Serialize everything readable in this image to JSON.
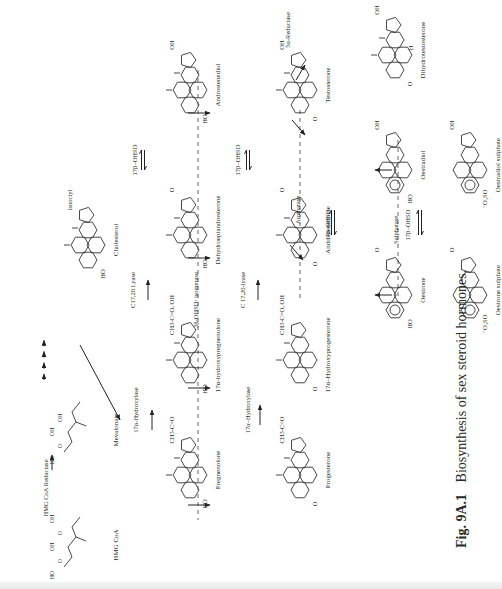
{
  "figure": {
    "caption_label": "Fig. 9A.1",
    "caption_text": "Biosynthesis of sex steroid hormones.",
    "caption_pos": {
      "x": 466,
      "y": 548
    },
    "rotation_deg": -90
  },
  "compounds": [
    {
      "id": "hmg-coa",
      "name": "HMG CoA",
      "x": 78,
      "y": 545,
      "kind": "acyclic",
      "groups": [
        "HO",
        "O",
        "OH",
        "O",
        "OH"
      ]
    },
    {
      "id": "mevalonate",
      "name": "Mevalonate",
      "x": 78,
      "y": 430,
      "kind": "acyclic",
      "groups": [
        "HO",
        "O",
        "OH",
        "OH"
      ]
    },
    {
      "id": "cholesterol",
      "name": "Cholesterol",
      "x": 78,
      "y": 240,
      "kind": "steroid",
      "ring_a": "HO",
      "side": "isooctyl"
    },
    {
      "id": "pregnenolone",
      "name": "Pregnenolone",
      "x": 180,
      "y": 470,
      "kind": "steroid",
      "ring_a": "HO",
      "side": "CH3-C=O"
    },
    {
      "id": "17a-hydroxypregnenolone",
      "name": "17α-hydroxypregnenolone",
      "x": 180,
      "y": 355,
      "kind": "steroid",
      "ring_a": "HO",
      "side": "CH3-C=O, OH"
    },
    {
      "id": "dehydroepiandrosterone",
      "name": "Dehydroepiandrosterone",
      "x": 180,
      "y": 230,
      "kind": "steroid",
      "ring_a": "HO",
      "side": "O"
    },
    {
      "id": "androstenediol",
      "name": "Androstenediol",
      "x": 180,
      "y": 85,
      "kind": "steroid",
      "ring_a": "HO",
      "side": "OH"
    },
    {
      "id": "progesterone",
      "name": "Progesterone",
      "x": 290,
      "y": 470,
      "kind": "steroid",
      "ring_a": "O",
      "side": "CH3-C=O"
    },
    {
      "id": "17a-hydroxyprogesterone",
      "name": "17α–Hydroxyprogesterone",
      "x": 290,
      "y": 355,
      "kind": "steroid",
      "ring_a": "O",
      "side": "CH3-C=O, OH"
    },
    {
      "id": "androstenedione",
      "name": "Androstenedione",
      "x": 290,
      "y": 230,
      "kind": "steroid",
      "ring_a": "O",
      "side": "O"
    },
    {
      "id": "testosterone",
      "name": "Testosterone",
      "x": 290,
      "y": 85,
      "kind": "steroid",
      "ring_a": "O",
      "side": "OH"
    },
    {
      "id": "oestrone",
      "name": "Oestrone",
      "x": 385,
      "y": 290,
      "kind": "aromatic",
      "ring_a": "HO",
      "side": "O"
    },
    {
      "id": "oestradiol",
      "name": "Oestradiol",
      "x": 385,
      "y": 165,
      "kind": "aromatic",
      "ring_a": "HO",
      "side": "OH"
    },
    {
      "id": "dihydrotestosterone",
      "name": "Dihydrotestosterone",
      "x": 385,
      "y": 50,
      "kind": "steroid",
      "ring_a": "O",
      "side": "OH",
      "extra": "H"
    },
    {
      "id": "oestrone-sulphate",
      "name": "Oestrone sulphate",
      "x": 460,
      "y": 290,
      "kind": "aromatic",
      "ring_a": "⁻O₃SO",
      "side": "O"
    },
    {
      "id": "oestradiol-sulphate",
      "name": "Oestradiol sulphate",
      "x": 460,
      "y": 165,
      "kind": "aromatic",
      "ring_a": "⁻O₃SO",
      "side": "OH"
    }
  ],
  "enzymes": [
    {
      "id": "hmg-coa-reductase",
      "label": "HMG CoA Reductase",
      "x": 48,
      "y": 488
    },
    {
      "id": "17a-hydroxylase-1",
      "label": "17α-Hydroxylase",
      "x": 138,
      "y": 410
    },
    {
      "id": "c1720-lyase-1",
      "label": "C17,20 Lyase",
      "x": 135,
      "y": 290
    },
    {
      "id": "17b-ohsd-1",
      "label": "17β–OHSD",
      "x": 137,
      "y": 160
    },
    {
      "id": "3b-ohsd-isomerase",
      "label": "3β-OHSD/ isomerase",
      "x": 198,
      "y": 300
    },
    {
      "id": "17a-hydroxylase-2",
      "label": "17α–Hydroxylase",
      "x": 250,
      "y": 410
    },
    {
      "id": "c1720-lyase-2",
      "label": "C 17,20-lyase",
      "x": 245,
      "y": 290
    },
    {
      "id": "17b-ohsd-2",
      "label": "17β–OHSD",
      "x": 240,
      "y": 160
    },
    {
      "id": "5a-reductase",
      "label": "5α-Reductase",
      "x": 290,
      "y": 30
    },
    {
      "id": "aromatase",
      "label": "Aromatase",
      "x": 300,
      "y": 210
    },
    {
      "id": "17b-ohsd-3",
      "label": "17β–OHSD",
      "x": 330,
      "y": 225
    },
    {
      "id": "sulphatase",
      "label": "Sulphatase",
      "x": 398,
      "y": 230
    },
    {
      "id": "17b-ohsd-4",
      "label": "17β–OHSD",
      "x": 410,
      "y": 225
    }
  ],
  "separators": [
    {
      "id": "sep-3b-ohsd",
      "x": 198,
      "y1": 70,
      "y2": 520
    },
    {
      "id": "sep-aromatase",
      "x": 300,
      "y1": 110,
      "y2": 300
    },
    {
      "id": "sep-sulphatase",
      "x": 398,
      "y1": 140,
      "y2": 300
    }
  ],
  "arrows": [
    {
      "id": "hmg-to-mev",
      "x1": 52,
      "y1": 470,
      "x2": 52,
      "y2": 455
    },
    {
      "id": "mev-to-chol",
      "dotted": true,
      "x1": 44,
      "y1": 380,
      "x2": 44,
      "y2": 335
    },
    {
      "id": "chol-to-preg",
      "x1": 80,
      "y1": 345,
      "x2": 120,
      "y2": 420
    },
    {
      "id": "preg-to-17oh",
      "x1": 152,
      "y1": 430,
      "x2": 152,
      "y2": 410
    },
    {
      "id": "17oh-to-dhea",
      "x1": 148,
      "y1": 300,
      "x2": 148,
      "y2": 280
    },
    {
      "id": "dhea-androstenediol",
      "x1": 143,
      "y1": 170,
      "x2": 143,
      "y2": 150,
      "reversible": true
    },
    {
      "id": "preg-to-prog",
      "x1": 188,
      "y1": 505,
      "x2": 210,
      "y2": 505
    },
    {
      "id": "17ohpreg-to-17ohprog",
      "x1": 188,
      "y1": 388,
      "x2": 210,
      "y2": 388
    },
    {
      "id": "dhea-to-adione",
      "x1": 188,
      "y1": 258,
      "x2": 210,
      "y2": 258
    },
    {
      "id": "adiol-to-testo",
      "x1": 188,
      "y1": 113,
      "x2": 210,
      "y2": 113
    },
    {
      "id": "prog-to-17ohprog",
      "x1": 260,
      "y1": 425,
      "x2": 260,
      "y2": 405
    },
    {
      "id": "17ohprog-to-adione",
      "x1": 258,
      "y1": 300,
      "x2": 258,
      "y2": 280
    },
    {
      "id": "adione-testo",
      "x1": 248,
      "y1": 170,
      "x2": 248,
      "y2": 150,
      "reversible": true
    },
    {
      "id": "testo-to-dht",
      "x1": 296,
      "y1": 80,
      "x2": 305,
      "y2": 65
    },
    {
      "id": "adione-to-oestrone",
      "x1": 290,
      "y1": 245,
      "x2": 303,
      "y2": 260
    },
    {
      "id": "testo-to-oestradiol",
      "x1": 292,
      "y1": 120,
      "x2": 305,
      "y2": 135
    },
    {
      "id": "oestrone-oestradiol",
      "x1": 333,
      "y1": 235,
      "x2": 333,
      "y2": 210,
      "reversible": true
    },
    {
      "id": "esulph-to-oestrone",
      "x1": 392,
      "y1": 295,
      "x2": 375,
      "y2": 295
    },
    {
      "id": "e2sulph-to-oestradiol",
      "x1": 392,
      "y1": 170,
      "x2": 375,
      "y2": 170
    },
    {
      "id": "esulph-e2sulph",
      "x1": 420,
      "y1": 235,
      "x2": 420,
      "y2": 210,
      "reversible": true
    }
  ]
}
